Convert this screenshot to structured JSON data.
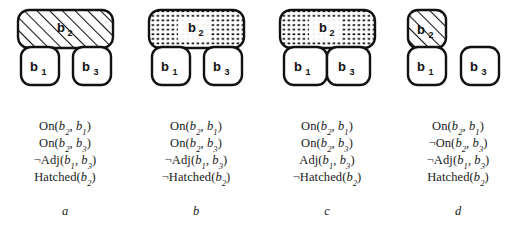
{
  "figure": {
    "panels": [
      {
        "id": "a",
        "label": "a",
        "blocks": [
          {
            "name": "b2",
            "base": "b",
            "sub": "2",
            "fill": "hatched",
            "shape": "wide-bar",
            "position": "top"
          },
          {
            "name": "b1",
            "base": "b",
            "sub": "1",
            "fill": "white",
            "shape": "square",
            "position": "bottom-left"
          },
          {
            "name": "b3",
            "base": "b",
            "sub": "3",
            "fill": "white",
            "shape": "square",
            "position": "bottom-right"
          }
        ],
        "adjacent_b1_b3": false,
        "formulas": [
          {
            "neg": "",
            "pred": "On",
            "args": [
              "b",
              "2",
              "b",
              "1"
            ]
          },
          {
            "neg": "",
            "pred": "On",
            "args": [
              "b",
              "2",
              "b",
              "3"
            ]
          },
          {
            "neg": "¬",
            "pred": "Adj",
            "args": [
              "b",
              "1",
              "b",
              "3"
            ]
          },
          {
            "neg": "",
            "pred": "Hatched",
            "args": [
              "b",
              "2"
            ]
          }
        ]
      },
      {
        "id": "b",
        "label": "b",
        "blocks": [
          {
            "name": "b2",
            "base": "b",
            "sub": "2",
            "fill": "dotted",
            "shape": "wide-bar",
            "position": "top"
          },
          {
            "name": "b1",
            "base": "b",
            "sub": "1",
            "fill": "white",
            "shape": "square",
            "position": "bottom-left"
          },
          {
            "name": "b3",
            "base": "b",
            "sub": "3",
            "fill": "white",
            "shape": "square",
            "position": "bottom-right"
          }
        ],
        "adjacent_b1_b3": false,
        "formulas": [
          {
            "neg": "",
            "pred": "On",
            "args": [
              "b",
              "2",
              "b",
              "1"
            ]
          },
          {
            "neg": "",
            "pred": "On",
            "args": [
              "b",
              "2",
              "b",
              "3"
            ]
          },
          {
            "neg": "¬",
            "pred": "Adj",
            "args": [
              "b",
              "1",
              "b",
              "3"
            ]
          },
          {
            "neg": "¬",
            "pred": "Hatched",
            "args": [
              "b",
              "2"
            ]
          }
        ]
      },
      {
        "id": "c",
        "label": "c",
        "blocks": [
          {
            "name": "b2",
            "base": "b",
            "sub": "2",
            "fill": "dotted",
            "shape": "wide-bar",
            "position": "top"
          },
          {
            "name": "b1",
            "base": "b",
            "sub": "1",
            "fill": "white",
            "shape": "square",
            "position": "bottom-left"
          },
          {
            "name": "b3",
            "base": "b",
            "sub": "3",
            "fill": "white",
            "shape": "square",
            "position": "bottom-right"
          }
        ],
        "adjacent_b1_b3": true,
        "formulas": [
          {
            "neg": "",
            "pred": "On",
            "args": [
              "b",
              "2",
              "b",
              "1"
            ]
          },
          {
            "neg": "",
            "pred": "On",
            "args": [
              "b",
              "2",
              "b",
              "3"
            ]
          },
          {
            "neg": "",
            "pred": "Adj",
            "args": [
              "b",
              "1",
              "b",
              "3"
            ]
          },
          {
            "neg": "¬",
            "pred": "Hatched",
            "args": [
              "b",
              "2"
            ]
          }
        ]
      },
      {
        "id": "d",
        "label": "d",
        "blocks": [
          {
            "name": "b2",
            "base": "b",
            "sub": "2",
            "fill": "hatched",
            "shape": "square",
            "position": "top-left"
          },
          {
            "name": "b1",
            "base": "b",
            "sub": "1",
            "fill": "white",
            "shape": "square",
            "position": "bottom-left"
          },
          {
            "name": "b3",
            "base": "b",
            "sub": "3",
            "fill": "white",
            "shape": "square",
            "position": "bottom-right-detached"
          }
        ],
        "adjacent_b1_b3": false,
        "formulas": [
          {
            "neg": "",
            "pred": "On",
            "args": [
              "b",
              "2",
              "b",
              "1"
            ]
          },
          {
            "neg": "¬",
            "pred": "On",
            "args": [
              "b",
              "2",
              "b",
              "3"
            ]
          },
          {
            "neg": "¬",
            "pred": "Adj",
            "args": [
              "b",
              "1",
              "b",
              "3"
            ]
          },
          {
            "neg": "",
            "pred": "Hatched",
            "args": [
              "b",
              "2"
            ]
          }
        ]
      }
    ]
  },
  "colors": {
    "stroke": "#111111",
    "fill": "#ffffff",
    "background": "#ffffff",
    "text": "#1a1a1a"
  }
}
